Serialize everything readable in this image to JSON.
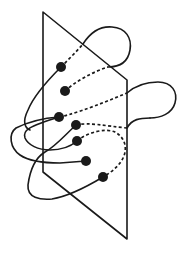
{
  "diagram": {
    "colors": {
      "ink": "#1a1a1a",
      "background": "#ffffff"
    },
    "plane": {
      "points": [
        [
          43,
          12
        ],
        [
          127,
          80
        ],
        [
          127,
          239
        ],
        [
          43,
          172
        ]
      ]
    },
    "intersection_points": [
      {
        "x": 61,
        "y": 67
      },
      {
        "x": 65,
        "y": 91
      },
      {
        "x": 59,
        "y": 117
      },
      {
        "x": 76,
        "y": 125
      },
      {
        "x": 77,
        "y": 141
      },
      {
        "x": 86,
        "y": 161
      },
      {
        "x": 103,
        "y": 177
      }
    ],
    "point_count": 7
  }
}
